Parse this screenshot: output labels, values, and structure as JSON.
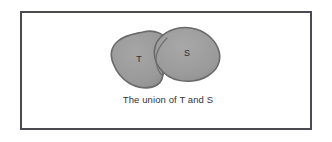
{
  "figure": {
    "caption": "The union of T and S",
    "frame": {
      "border_color": "#4a4a52",
      "background_color": "#ffffff"
    },
    "diagram": {
      "type": "venn-union",
      "fill_color": "#9a9a9a",
      "outline_color": "#6a6a6a",
      "shade_light": "#a8a8a8",
      "shade_dark": "#8a8a8a",
      "sets": [
        {
          "id": "set-t",
          "label": "T",
          "position": "left"
        },
        {
          "id": "set-s",
          "label": "S",
          "position": "right"
        }
      ],
      "relation": "union",
      "overlap": true
    }
  }
}
